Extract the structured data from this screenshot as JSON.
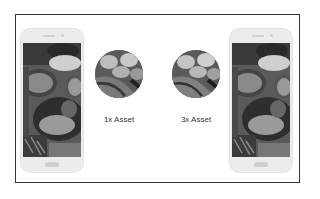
{
  "diagram": {
    "left_phone": {
      "image": "spices-bowls-photo-grayscale"
    },
    "right_phone": {
      "image": "spices-bowls-photo-grayscale"
    },
    "assets": [
      {
        "label": "1x Asset",
        "image": "blurry-closeup-crop"
      },
      {
        "label": "3x Asset",
        "image": "closeup-crop"
      }
    ]
  }
}
